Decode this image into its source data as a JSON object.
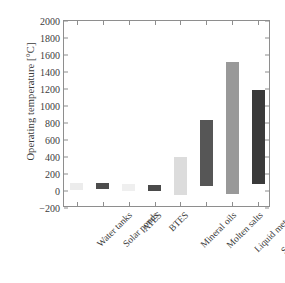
{
  "chart_data": {
    "type": "bar",
    "title": "",
    "xlabel": "",
    "ylabel": "Operating temperature [°C]",
    "ylim": [
      -200,
      2000
    ],
    "yticks": [
      -200,
      0,
      200,
      400,
      600,
      800,
      1000,
      1200,
      1400,
      1600,
      1800,
      2000
    ],
    "grid": false,
    "legend": "none",
    "note": "Floating (range) bars: each bar spans from its minimum to its maximum operating temperature.",
    "categories": [
      "Water tanks",
      "Solar ponds",
      "ATES",
      "BTES",
      "Mineral oils",
      "Molten salts",
      "Liquid metals",
      "Solid particles"
    ],
    "series": [
      {
        "name": "Operating temperature range low",
        "values": [
          10,
          20,
          5,
          5,
          -50,
          60,
          -30,
          80
        ]
      },
      {
        "name": "Operating temperature range high",
        "values": [
          100,
          90,
          80,
          70,
          400,
          840,
          1520,
          1190
        ]
      }
    ],
    "bar_colors": [
      "#ececec",
      "#4d4d4d",
      "#efefef",
      "#4a4a4a",
      "#dcdcdc",
      "#565656",
      "#999999",
      "#3a3a3a"
    ]
  },
  "axis": {
    "y_title": "Operating temperature [°C]",
    "y_tick_labels": [
      "2000",
      "1800",
      "1600",
      "1400",
      "1200",
      "1000",
      "800",
      "600",
      "400",
      "200",
      "0",
      "-200"
    ]
  }
}
